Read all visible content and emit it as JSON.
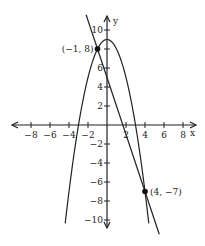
{
  "chart_data": {
    "type": "line",
    "title": "",
    "xlabel": "x",
    "ylabel": "y",
    "xlim": [
      -9,
      9
    ],
    "ylim": [
      -11,
      11
    ],
    "grid": false,
    "x_ticks": [
      -8,
      -6,
      -4,
      -2,
      2,
      4,
      6,
      8
    ],
    "y_ticks": [
      10,
      8,
      6,
      4,
      2,
      -2,
      -4,
      -6,
      -8,
      -10
    ],
    "x_tick_labels": [
      "-8",
      "-6",
      "-4",
      "-2",
      "2",
      "4",
      "6",
      "8"
    ],
    "y_tick_labels": [
      "10",
      "6",
      "4",
      "2",
      "-2",
      "-4",
      "-6",
      "-8",
      "-10"
    ],
    "series": [
      {
        "name": "parabola",
        "equation": "y = 9 - x^2",
        "vertex": [
          0,
          9
        ]
      },
      {
        "name": "line",
        "equation": "y = -3x + 5",
        "y_intercept": 5
      }
    ],
    "points": [
      {
        "label": "(−1, 8)",
        "x": -1,
        "y": 8
      },
      {
        "label": "(4, −7)",
        "x": 4,
        "y": -7
      }
    ],
    "legend": null
  }
}
